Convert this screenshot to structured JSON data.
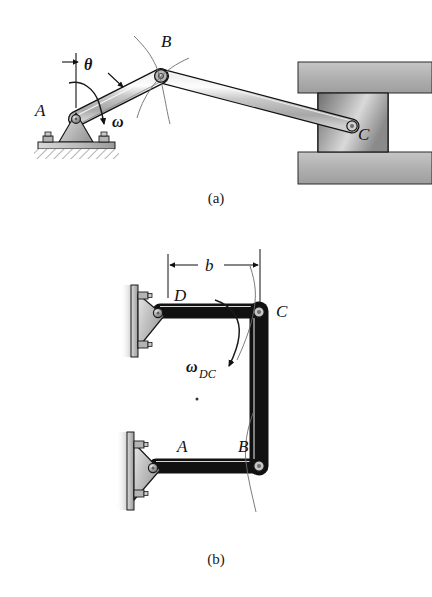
{
  "figure": {
    "captions": {
      "a": "(a)",
      "b": "(b)"
    }
  },
  "panel_a": {
    "name": "slider-crank mechanism",
    "labels": {
      "pivot_a": "A",
      "joint_b": "B",
      "slider_c": "C",
      "angle_theta": "θ",
      "omega": "ω"
    },
    "elements": {
      "ground_support": "fixed pin support on bolted base plate",
      "crank_ab": "crank link from A to B",
      "coupler_bc": "coupler link from B to slider C",
      "guide": "horizontal slider guide between two fixed walls",
      "slider_block": "slider block at C"
    }
  },
  "panel_b": {
    "name": "four-bar linkage",
    "labels": {
      "pivot_d": "D",
      "pivot_a": "A",
      "joint_b": "B",
      "joint_c": "C",
      "omega_dc_base": "ω",
      "omega_dc_sub": "DC",
      "dimension_b": "b"
    },
    "elements": {
      "wall_bracket_d": "wall mounted pin bracket at D",
      "wall_bracket_a": "wall mounted pin bracket at A",
      "link_dc": "horizontal link from D to C",
      "link_ab": "horizontal link from A to B",
      "coupler_bc": "vertical coupler link from B to C",
      "dimension_line": "dimension b between D and C"
    }
  },
  "colors": {
    "link_fill": "#b9b9b9",
    "link_fill_light": "#d6d6d6",
    "link_stroke": "#111111",
    "wall_fill": "#b0b0b0",
    "block_fill": "#9a9a9a",
    "pin_fill": "#8d8d8d",
    "ink": "#111111"
  }
}
